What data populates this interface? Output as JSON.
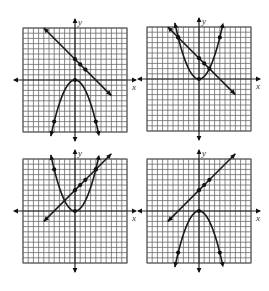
{
  "chart_data": [
    {
      "type": "line",
      "title": "",
      "xlabel": "x",
      "ylabel": "y",
      "xlim": [
        -10,
        10
      ],
      "ylim": [
        -10,
        10
      ],
      "grid": true,
      "position": "top-left",
      "series": [
        {
          "name": "line",
          "equation": "y = -x + 4",
          "x": [
            -6,
            7
          ],
          "y": [
            10,
            -3
          ],
          "points": [
            [
              0,
              4
            ],
            [
              1,
              3
            ],
            [
              2,
              2
            ]
          ]
        },
        {
          "name": "parabola",
          "equation": "y = -0.5x^2",
          "vertex": [
            0,
            0
          ],
          "opens": "down",
          "points": [
            [
              -4,
              -8
            ],
            [
              0,
              0
            ],
            [
              4,
              -8
            ]
          ]
        }
      ]
    },
    {
      "type": "line",
      "title": "",
      "xlabel": "x",
      "ylabel": "y",
      "xlim": [
        -10,
        10
      ],
      "ylim": [
        -10,
        10
      ],
      "grid": true,
      "position": "top-right",
      "series": [
        {
          "name": "line",
          "equation": "y = -x + 4",
          "x": [
            -6,
            7
          ],
          "y": [
            10,
            -3
          ],
          "points": [
            [
              -4,
              8
            ],
            [
              0,
              4
            ],
            [
              1,
              3
            ],
            [
              2,
              2
            ]
          ]
        },
        {
          "name": "parabola",
          "equation": "y = 0.5x^2",
          "vertex": [
            0,
            0
          ],
          "opens": "up",
          "points": [
            [
              -4,
              8
            ],
            [
              0,
              0
            ],
            [
              4,
              8
            ]
          ]
        }
      ]
    },
    {
      "type": "line",
      "title": "",
      "xlabel": "x",
      "ylabel": "y",
      "xlim": [
        -10,
        10
      ],
      "ylim": [
        -10,
        10
      ],
      "grid": true,
      "position": "bottom-left",
      "series": [
        {
          "name": "line",
          "equation": "y = x + 4",
          "x": [
            -6,
            7
          ],
          "y": [
            -2,
            11
          ],
          "points": [
            [
              0,
              4
            ],
            [
              1,
              5
            ],
            [
              2,
              6
            ],
            [
              4,
              8
            ]
          ]
        },
        {
          "name": "parabola",
          "equation": "y = 0.5x^2",
          "vertex": [
            0,
            0
          ],
          "opens": "up",
          "points": [
            [
              -4,
              8
            ],
            [
              0,
              0
            ],
            [
              4,
              8
            ]
          ]
        }
      ]
    },
    {
      "type": "line",
      "title": "",
      "xlabel": "x",
      "ylabel": "y",
      "xlim": [
        -10,
        10
      ],
      "ylim": [
        -10,
        10
      ],
      "grid": true,
      "position": "bottom-right",
      "series": [
        {
          "name": "line",
          "equation": "y = x + 4",
          "x": [
            -6,
            7
          ],
          "y": [
            -2,
            11
          ],
          "points": [
            [
              0,
              4
            ],
            [
              1,
              5
            ],
            [
              2,
              6
            ]
          ]
        },
        {
          "name": "parabola",
          "equation": "y = -0.5x^2",
          "vertex": [
            0,
            0
          ],
          "opens": "down",
          "points": [
            [
              -4,
              -8
            ],
            [
              0,
              0
            ],
            [
              4,
              -8
            ]
          ]
        }
      ]
    }
  ],
  "graphs": [
    {
      "ox": 75,
      "oy": 80,
      "x_label": "x",
      "y_label": "y"
    },
    {
      "ox": 199,
      "oy": 79,
      "x_label": "x",
      "y_label": "y"
    },
    {
      "ox": 75,
      "oy": 211,
      "x_label": "x",
      "y_label": "y"
    },
    {
      "ox": 199,
      "oy": 211,
      "x_label": "x",
      "y_label": "y"
    }
  ],
  "style": {
    "grid_color": "#6a6a6a",
    "curve_color": "#1a1a1a",
    "background": "#ffffff"
  }
}
